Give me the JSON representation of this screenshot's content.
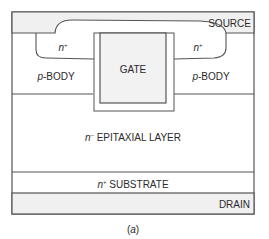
{
  "figure": {
    "caption": "(a)",
    "caption_italic": "a"
  },
  "layers": {
    "source": {
      "label": "SOURCE"
    },
    "gate": {
      "label": "GATE"
    },
    "n_plus_left": {
      "sup_base": "n",
      "sup": "+"
    },
    "n_plus_right": {
      "sup_base": "n",
      "sup": "+"
    },
    "p_body_left": {
      "prefix": "p",
      "label": "-BODY"
    },
    "p_body_right": {
      "prefix": "p",
      "label": "-BODY"
    },
    "epitaxial": {
      "prefix": "n",
      "sup": "–",
      "label": " EPITAXIAL LAYER"
    },
    "substrate": {
      "prefix": "n",
      "sup": "+",
      "label": " SUBSTRATE"
    },
    "drain": {
      "label": "DRAIN"
    }
  },
  "colors": {
    "line": "#555555",
    "metal_fill": "#f0f0f0",
    "gate_fill": "#f2f2f2",
    "background": "#ffffff"
  }
}
